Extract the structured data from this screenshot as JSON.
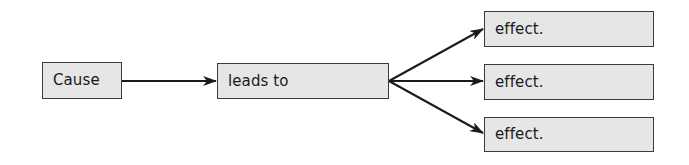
{
  "diagram": {
    "type": "cause-effect flow",
    "nodes": [
      {
        "id": "cause",
        "label": "Cause"
      },
      {
        "id": "leads_to",
        "label": "leads to"
      },
      {
        "id": "effect_1",
        "label": "effect."
      },
      {
        "id": "effect_2",
        "label": "effect."
      },
      {
        "id": "effect_3",
        "label": "effect."
      }
    ],
    "edges": [
      {
        "from": "cause",
        "to": "leads_to"
      },
      {
        "from": "leads_to",
        "to": "effect_1"
      },
      {
        "from": "leads_to",
        "to": "effect_2"
      },
      {
        "from": "leads_to",
        "to": "effect_3"
      }
    ],
    "colors": {
      "node_fill": "#e6e6e6",
      "node_border": "#3a3a3a",
      "arrow": "#1a1a1a",
      "text": "#1a1a1a"
    }
  }
}
